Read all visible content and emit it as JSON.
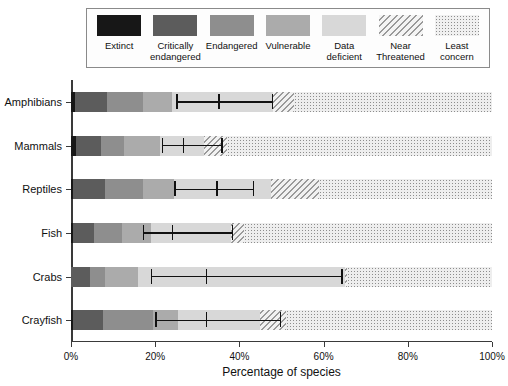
{
  "chart_data": {
    "type": "bar",
    "orientation": "horizontal",
    "stacked": true,
    "title": "",
    "xlabel": "Percentage of species",
    "ylabel": "",
    "xlim": [
      0,
      100
    ],
    "xticks": [
      "0%",
      "20%",
      "40%",
      "60%",
      "80%",
      "100%"
    ],
    "xtick_values": [
      0,
      20,
      40,
      60,
      80,
      100
    ],
    "grid": false,
    "legend_position": "top",
    "categories": [
      "Amphibians",
      "Mammals",
      "Reptiles",
      "Fish",
      "Crabs",
      "Crayfish"
    ],
    "series": [
      {
        "name": "Extinct",
        "color": "#171717",
        "pattern": "solid",
        "values": [
          1.0,
          1.2,
          0.5,
          0.5,
          0.0,
          0.5
        ]
      },
      {
        "name": "Critically endangered",
        "color": "#5c5c5c",
        "pattern": "solid",
        "values": [
          7.5,
          6.0,
          7.5,
          5.0,
          4.5,
          7.0
        ]
      },
      {
        "name": "Endangered",
        "color": "#8e8e8e",
        "pattern": "solid",
        "values": [
          8.5,
          5.5,
          9.0,
          6.5,
          3.5,
          12.0
        ]
      },
      {
        "name": "Vulnerable",
        "color": "#ababab",
        "pattern": "solid",
        "values": [
          7.0,
          8.5,
          7.5,
          7.0,
          8.0,
          6.0
        ]
      },
      {
        "name": "Data deficient",
        "color": "#d8d8d8",
        "pattern": "solid",
        "values": [
          24.0,
          10.3,
          23.0,
          19.0,
          49.0,
          19.5
        ]
      },
      {
        "name": "Near Threatened",
        "color": "#9a9a9a",
        "pattern": "diagonal-hatch",
        "values": [
          5.0,
          5.5,
          11.5,
          3.0,
          0.5,
          6.0
        ]
      },
      {
        "name": "Least concern",
        "color": "#8d8d8d",
        "pattern": "dots",
        "values": [
          47.0,
          63.0,
          41.0,
          59.0,
          34.5,
          49.0
        ]
      }
    ],
    "error_bars": {
      "description": "Horizontal error bars with central estimate and lower/upper bounds for threatened proportion",
      "values": [
        {
          "category": "Amphibians",
          "lower": 25.0,
          "center": 35.0,
          "upper": 48.0
        },
        {
          "category": "Mammals",
          "lower": 21.5,
          "center": 26.5,
          "upper": 36.0
        },
        {
          "category": "Reptiles",
          "lower": 24.5,
          "center": 34.5,
          "upper": 43.5
        },
        {
          "category": "Fish",
          "lower": 17.0,
          "center": 24.0,
          "upper": 38.5
        },
        {
          "category": "Crabs",
          "lower": 19.0,
          "center": 32.0,
          "upper": 64.5
        },
        {
          "category": "Crayfish",
          "lower": 20.0,
          "center": 32.0,
          "upper": 50.0
        }
      ]
    }
  },
  "legend": {
    "items": [
      {
        "label": "Extinct",
        "icon": "swatch-extinct"
      },
      {
        "label": "Critically\nendangered",
        "icon": "swatch-critically-endangered"
      },
      {
        "label": "Endangered",
        "icon": "swatch-endangered"
      },
      {
        "label": "Vulnerable",
        "icon": "swatch-vulnerable"
      },
      {
        "label": "Data\ndeficient",
        "icon": "swatch-data-deficient"
      },
      {
        "label": "Near\nThreatened",
        "icon": "swatch-near-threatened"
      },
      {
        "label": "Least\nconcern",
        "icon": "swatch-least-concern"
      }
    ]
  },
  "axes": {
    "xlabel": "Percentage of species",
    "xticklabels": [
      "0%",
      "20%",
      "40%",
      "60%",
      "80%",
      "100%"
    ],
    "yticklabels": [
      "Amphibians",
      "Mammals",
      "Reptiles",
      "Fish",
      "Crabs",
      "Crayfish"
    ]
  }
}
